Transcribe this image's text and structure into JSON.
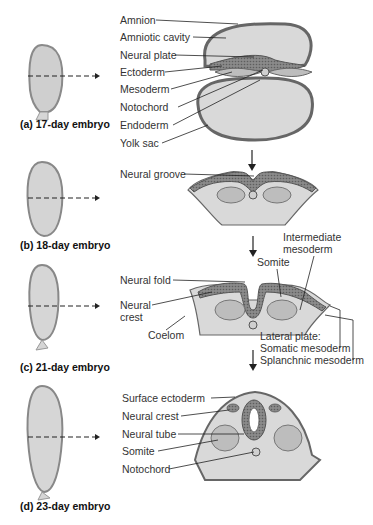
{
  "figure": {
    "colors": {
      "ectoderm_dark": "#6e6e6e",
      "neural_hatch": "#7a7a7a",
      "mesoderm": "#bdbdbd",
      "cavity": "#d9d9d9",
      "outline": "#555555",
      "text": "#333333"
    }
  },
  "stages": [
    {
      "caption": "(a) 17-day embryo",
      "labels": [
        "Amnion",
        "Amniotic cavity",
        "Neural plate",
        "Ectoderm",
        "Mesoderm",
        "Notochord",
        "Endoderm",
        "Yolk sac"
      ]
    },
    {
      "caption": "(b) 18-day embryo",
      "labels": [
        "Neural groove"
      ]
    },
    {
      "caption": "(c) 21-day embryo",
      "labels": [
        "Neural fold",
        "Neural",
        "crest",
        "Coelom",
        "Somite",
        "Intermediate",
        "mesoderm",
        "Lateral plate:",
        "Somatic mesoderm",
        "Splanchnic mesoderm"
      ]
    },
    {
      "caption": "(d) 23-day embryo",
      "labels": [
        "Surface ectoderm",
        "Neural crest",
        "Neural tube",
        "Somite",
        "Notochord"
      ]
    }
  ]
}
